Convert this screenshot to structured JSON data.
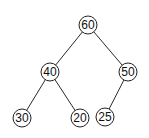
{
  "diagram": {
    "type": "binary-tree",
    "nodes": [
      {
        "id": "n60",
        "label": "60",
        "x": 88,
        "y": 25
      },
      {
        "id": "n40",
        "label": "40",
        "x": 50,
        "y": 72
      },
      {
        "id": "n50",
        "label": "50",
        "x": 128,
        "y": 72
      },
      {
        "id": "n30",
        "label": "30",
        "x": 22,
        "y": 118
      },
      {
        "id": "n20",
        "label": "20",
        "x": 80,
        "y": 118
      },
      {
        "id": "n25",
        "label": "25",
        "x": 105,
        "y": 117
      }
    ],
    "edges": [
      {
        "from": "n60",
        "to": "n40"
      },
      {
        "from": "n60",
        "to": "n50"
      },
      {
        "from": "n40",
        "to": "n30"
      },
      {
        "from": "n40",
        "to": "n20"
      },
      {
        "from": "n50",
        "to": "n25"
      }
    ],
    "node_radius": 9,
    "colors": {
      "stroke": "#222222",
      "fill": "#ffffff",
      "text": "#111111"
    }
  }
}
